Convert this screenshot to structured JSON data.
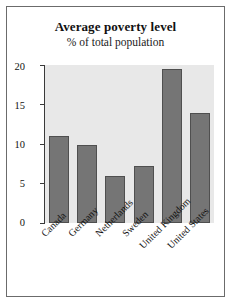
{
  "chart_data": {
    "type": "bar",
    "title": "Average poverty level",
    "subtitle": "% of total population",
    "xlabel": "",
    "ylabel": "",
    "ylim": [
      0,
      20
    ],
    "yticks": [
      "0",
      "5",
      "10",
      "15",
      "20"
    ],
    "grid": false,
    "legend": "none",
    "categories": [
      "Canada",
      "Germany",
      "Netherlands",
      "Sweden",
      "United Kingdom",
      "United States"
    ],
    "values": [
      11.0,
      9.9,
      6.0,
      7.2,
      19.5,
      13.9
    ],
    "colors": {
      "bar_fill": "#757575",
      "bar_edge": "#4f4f4f",
      "plot_background": "#e8e8e8",
      "figure_border": "#6b6b6b",
      "axis": "#3a3a3a",
      "text": "#111111"
    }
  }
}
